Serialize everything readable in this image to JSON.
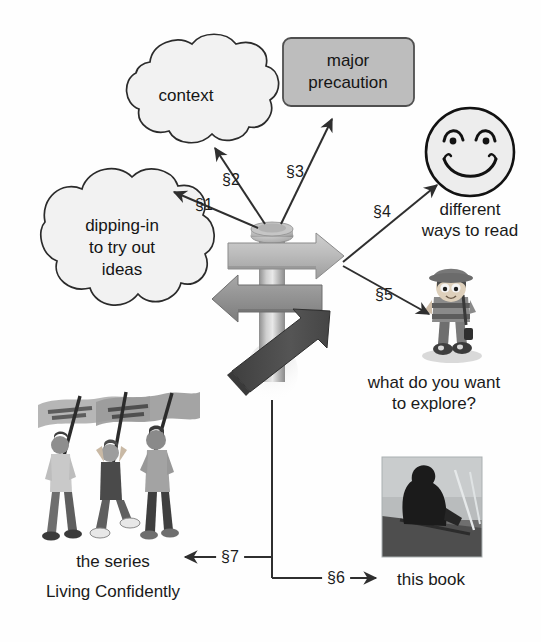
{
  "diagram": {
    "title_hidden": "signpost roadmap diagram",
    "background": "#fefefe",
    "ink": "#1a1a1a",
    "nodes": {
      "context_cloud": {
        "label": "context",
        "shape": "cloud",
        "fill": "#f2f2f2",
        "stroke": "#2b2b2b"
      },
      "precaution_box": {
        "line1": "major",
        "line2": "precaution",
        "shape": "rounded-rect",
        "fill": "#bdbdbd",
        "stroke": "#4a4a4a"
      },
      "dipping_cloud": {
        "line1": "dipping-in",
        "line2": "to try out",
        "line3": "ideas",
        "shape": "cloud",
        "fill": "#f2f2f2",
        "stroke": "#2b2b2b"
      },
      "smiley": {
        "shape": "smiley-face",
        "fill": "#ededed",
        "stroke": "#121212"
      },
      "smiley_caption": {
        "line1": "different",
        "line2": "ways to read"
      },
      "explorer": {
        "shape": "cartoon-hiker"
      },
      "explorer_caption": {
        "line1": "what do you want",
        "line2": "to explore?"
      },
      "series_illustration": {
        "shape": "three-people-with-flags"
      },
      "series_caption": {
        "line1": "the series",
        "line2": "Living Confidently"
      },
      "book_photo": {
        "shape": "person-in-boat-photo"
      },
      "book_caption": {
        "line1": "this book"
      }
    },
    "signpost": {
      "pole_color_light": "#dedede",
      "pole_color_dark": "#9a9a9a",
      "arrow_right_fill": "#b5b5b5",
      "arrow_left_fill": "#8f8f8f",
      "arrow_diagonal_fill": "#4d4d4d",
      "cap_fill": "#b8b8b8"
    },
    "connectors": [
      {
        "id": "s1",
        "label": "§1",
        "from": "signpost",
        "to": "dipping_cloud"
      },
      {
        "id": "s2",
        "label": "§2",
        "from": "signpost",
        "to": "context_cloud"
      },
      {
        "id": "s3",
        "label": "§3",
        "from": "signpost",
        "to": "precaution_box"
      },
      {
        "id": "s4",
        "label": "§4",
        "from": "signpost",
        "to": "smiley"
      },
      {
        "id": "s5",
        "label": "§5",
        "from": "signpost",
        "to": "explorer"
      },
      {
        "id": "s6",
        "label": "§6",
        "from": "signpost",
        "to": "book_photo"
      },
      {
        "id": "s7",
        "label": "§7",
        "from": "signpost",
        "to": "series_illustration"
      }
    ]
  }
}
